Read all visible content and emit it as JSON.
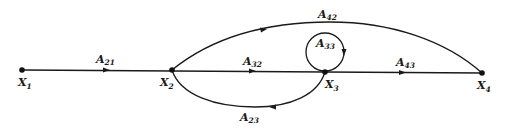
{
  "diagram": {
    "type": "signal-flow-graph",
    "nodes": [
      {
        "id": "X1",
        "base": "X",
        "sub": "1",
        "x": 22,
        "y": 70
      },
      {
        "id": "X2",
        "base": "X",
        "sub": "2",
        "x": 172,
        "y": 70
      },
      {
        "id": "X3",
        "base": "X",
        "sub": "3",
        "x": 325,
        "y": 72
      },
      {
        "id": "X4",
        "base": "X",
        "sub": "4",
        "x": 482,
        "y": 73
      }
    ],
    "edges": [
      {
        "id": "A21",
        "base": "A",
        "sub": "21",
        "from": "X1",
        "to": "X2"
      },
      {
        "id": "A32",
        "base": "A",
        "sub": "32",
        "from": "X2",
        "to": "X3"
      },
      {
        "id": "A43",
        "base": "A",
        "sub": "43",
        "from": "X3",
        "to": "X4"
      },
      {
        "id": "A42",
        "base": "A",
        "sub": "42",
        "from": "X2",
        "to": "X4"
      },
      {
        "id": "A23",
        "base": "A",
        "sub": "23",
        "from": "X3",
        "to": "X2"
      },
      {
        "id": "A33",
        "base": "A",
        "sub": "33",
        "from": "X3",
        "to": "X3"
      }
    ],
    "color": "#1a1a1a"
  }
}
